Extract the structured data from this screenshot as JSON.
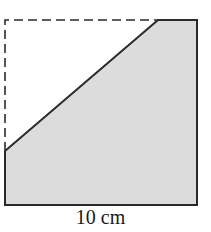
{
  "diagram": {
    "type": "geometry-square-with-cut-corner",
    "square": {
      "x": 5,
      "y": 20,
      "size": 192
    },
    "cut": {
      "left_point": [
        5,
        151
      ],
      "top_point": [
        158,
        20
      ]
    },
    "shaded_color": "#dcdcdc",
    "stroke_color": "#2a2a2a",
    "dashed_edges": [
      "left-upper",
      "top-left"
    ],
    "dimension_label": "10 cm"
  }
}
